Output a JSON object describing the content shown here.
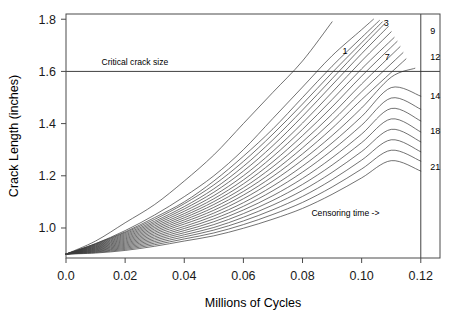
{
  "chart_data": {
    "type": "line",
    "title": "",
    "xlabel": "Millions of Cycles",
    "ylabel": "Crack Length (inches)",
    "xlim": [
      0.0,
      0.1265
    ],
    "ylim": [
      0.885,
      1.82
    ],
    "grid": false,
    "legend_position": "right-margin-curve-labels",
    "xticks": [
      0.0,
      0.02,
      0.04,
      0.06,
      0.08,
      0.1,
      0.12
    ],
    "xticklabels": [
      "0.0",
      "0.02",
      "0.04",
      "0.06",
      "0.08",
      "0.10",
      "0.12"
    ],
    "yticks": [
      1.0,
      1.2,
      1.4,
      1.6,
      1.8
    ],
    "yticklabels": [
      "1.0",
      "1.2",
      "1.4",
      "1.6",
      "1.8"
    ],
    "annotations": [
      {
        "name": "critical-crack-size",
        "text": "Critical crack size",
        "x": 0.012,
        "y": 1.625,
        "kind": "hline-label"
      },
      {
        "name": "censoring-time",
        "text": "Censoring time ->",
        "x": 0.083,
        "y": 1.045,
        "kind": "text"
      }
    ],
    "reference_lines": [
      {
        "name": "critical-crack-size-line",
        "orientation": "horizontal",
        "value": 1.6
      },
      {
        "name": "censoring-time-line",
        "orientation": "vertical",
        "value": 0.12
      }
    ],
    "start_point": {
      "x": 0.0,
      "y": 0.9
    },
    "series": [
      {
        "name": "1",
        "label_shown": true,
        "label_x": 0.0935,
        "label_y": 1.665,
        "x": [
          0.0,
          0.01,
          0.02,
          0.03,
          0.04,
          0.05,
          0.06,
          0.07,
          0.08,
          0.09
        ],
        "y": [
          0.9,
          0.95,
          1.02,
          1.09,
          1.18,
          1.28,
          1.4,
          1.52,
          1.64,
          1.79
        ]
      },
      {
        "name": "2",
        "label_shown": false,
        "x": [
          0.0,
          0.01,
          0.02,
          0.03,
          0.04,
          0.05,
          0.06,
          0.07,
          0.08,
          0.09,
          0.1,
          0.104
        ],
        "y": [
          0.9,
          0.94,
          0.99,
          1.05,
          1.12,
          1.2,
          1.3,
          1.42,
          1.54,
          1.66,
          1.76,
          1.8
        ]
      },
      {
        "name": "3",
        "label_shown": true,
        "label_x": 0.1075,
        "label_y": 1.775,
        "x": [
          0.0,
          0.01,
          0.02,
          0.03,
          0.04,
          0.05,
          0.06,
          0.07,
          0.08,
          0.09,
          0.1,
          0.106
        ],
        "y": [
          0.9,
          0.94,
          0.985,
          1.04,
          1.1,
          1.18,
          1.275,
          1.38,
          1.5,
          1.62,
          1.73,
          1.795
        ]
      },
      {
        "name": "4",
        "label_shown": false,
        "x": [
          0.0,
          0.01,
          0.02,
          0.03,
          0.04,
          0.05,
          0.06,
          0.07,
          0.08,
          0.09,
          0.1,
          0.107
        ],
        "y": [
          0.9,
          0.938,
          0.982,
          1.033,
          1.093,
          1.165,
          1.255,
          1.36,
          1.475,
          1.595,
          1.71,
          1.79
        ]
      },
      {
        "name": "5",
        "label_shown": false,
        "x": [
          0.0,
          0.01,
          0.02,
          0.03,
          0.04,
          0.05,
          0.06,
          0.07,
          0.08,
          0.09,
          0.1,
          0.108
        ],
        "y": [
          0.9,
          0.936,
          0.978,
          1.026,
          1.082,
          1.15,
          1.236,
          1.338,
          1.452,
          1.572,
          1.692,
          1.785
        ]
      },
      {
        "name": "6",
        "label_shown": false,
        "x": [
          0.0,
          0.01,
          0.02,
          0.03,
          0.04,
          0.05,
          0.06,
          0.07,
          0.08,
          0.09,
          0.1,
          0.109
        ],
        "y": [
          0.9,
          0.934,
          0.974,
          1.02,
          1.073,
          1.137,
          1.218,
          1.316,
          1.428,
          1.548,
          1.668,
          1.772
        ]
      },
      {
        "name": "7",
        "label_shown": true,
        "label_x": 0.1078,
        "label_y": 1.645,
        "x": [
          0.0,
          0.01,
          0.02,
          0.03,
          0.04,
          0.05,
          0.06,
          0.07,
          0.08,
          0.09,
          0.1,
          0.11
        ],
        "y": [
          0.9,
          0.932,
          0.97,
          1.014,
          1.064,
          1.124,
          1.2,
          1.294,
          1.402,
          1.52,
          1.64,
          1.752
        ]
      },
      {
        "name": "8",
        "label_shown": false,
        "x": [
          0.0,
          0.01,
          0.02,
          0.03,
          0.04,
          0.05,
          0.06,
          0.07,
          0.08,
          0.09,
          0.1,
          0.111
        ],
        "y": [
          0.9,
          0.93,
          0.966,
          1.008,
          1.055,
          1.112,
          1.184,
          1.274,
          1.378,
          1.492,
          1.61,
          1.73
        ]
      },
      {
        "name": "9",
        "label_shown": true,
        "label_x": 0.1232,
        "label_y": 1.745,
        "x": [
          0.0,
          0.01,
          0.02,
          0.03,
          0.04,
          0.05,
          0.06,
          0.07,
          0.08,
          0.09,
          0.1,
          0.112
        ],
        "y": [
          0.9,
          0.928,
          0.962,
          1.002,
          1.047,
          1.101,
          1.169,
          1.254,
          1.354,
          1.464,
          1.582,
          1.715
        ]
      },
      {
        "name": "10",
        "label_shown": false,
        "x": [
          0.0,
          0.01,
          0.02,
          0.03,
          0.04,
          0.05,
          0.06,
          0.07,
          0.08,
          0.09,
          0.1,
          0.113
        ],
        "y": [
          0.9,
          0.926,
          0.958,
          0.996,
          1.039,
          1.09,
          1.154,
          1.235,
          1.33,
          1.436,
          1.552,
          1.695
        ]
      },
      {
        "name": "11",
        "label_shown": false,
        "x": [
          0.0,
          0.01,
          0.02,
          0.03,
          0.04,
          0.05,
          0.06,
          0.07,
          0.08,
          0.09,
          0.1,
          0.114
        ],
        "y": [
          0.9,
          0.924,
          0.954,
          0.99,
          1.031,
          1.079,
          1.14,
          1.216,
          1.307,
          1.409,
          1.522,
          1.672
        ]
      },
      {
        "name": "12",
        "label_shown": true,
        "label_x": 0.1232,
        "label_y": 1.645,
        "x": [
          0.0,
          0.01,
          0.02,
          0.03,
          0.04,
          0.05,
          0.06,
          0.07,
          0.08,
          0.09,
          0.1,
          0.115
        ],
        "y": [
          0.9,
          0.922,
          0.95,
          0.984,
          1.023,
          1.068,
          1.126,
          1.198,
          1.284,
          1.382,
          1.492,
          1.648
        ]
      },
      {
        "name": "13",
        "label_shown": false,
        "x": [
          0.0,
          0.01,
          0.02,
          0.03,
          0.04,
          0.05,
          0.06,
          0.07,
          0.08,
          0.09,
          0.1,
          0.11,
          0.118
        ],
        "y": [
          0.9,
          0.92,
          0.946,
          0.978,
          1.015,
          1.057,
          1.112,
          1.18,
          1.261,
          1.354,
          1.46,
          1.578,
          1.612
        ]
      },
      {
        "name": "14",
        "label_shown": true,
        "label_x": 0.1232,
        "label_y": 1.495,
        "x": [
          0.0,
          0.01,
          0.02,
          0.03,
          0.04,
          0.05,
          0.06,
          0.07,
          0.08,
          0.09,
          0.1,
          0.11,
          0.12
        ],
        "y": [
          0.9,
          0.918,
          0.942,
          0.972,
          1.006,
          1.046,
          1.097,
          1.161,
          1.237,
          1.326,
          1.427,
          1.538,
          1.505
        ]
      },
      {
        "name": "15",
        "label_shown": false,
        "x": [
          0.0,
          0.01,
          0.02,
          0.03,
          0.04,
          0.05,
          0.06,
          0.07,
          0.08,
          0.09,
          0.1,
          0.11,
          0.12
        ],
        "y": [
          0.9,
          0.916,
          0.938,
          0.966,
          0.998,
          1.035,
          1.083,
          1.143,
          1.214,
          1.298,
          1.394,
          1.498,
          1.455
        ]
      },
      {
        "name": "16",
        "label_shown": false,
        "x": [
          0.0,
          0.01,
          0.02,
          0.03,
          0.04,
          0.05,
          0.06,
          0.07,
          0.08,
          0.09,
          0.1,
          0.11,
          0.12
        ],
        "y": [
          0.9,
          0.914,
          0.934,
          0.96,
          0.99,
          1.024,
          1.069,
          1.124,
          1.19,
          1.269,
          1.36,
          1.458,
          1.41
        ]
      },
      {
        "name": "17",
        "label_shown": false,
        "x": [
          0.0,
          0.01,
          0.02,
          0.03,
          0.04,
          0.05,
          0.06,
          0.07,
          0.08,
          0.09,
          0.1,
          0.11,
          0.12
        ],
        "y": [
          0.9,
          0.912,
          0.93,
          0.954,
          0.982,
          1.013,
          1.055,
          1.106,
          1.167,
          1.241,
          1.327,
          1.418,
          1.368
        ]
      },
      {
        "name": "18",
        "label_shown": true,
        "label_x": 0.1232,
        "label_y": 1.36,
        "x": [
          0.0,
          0.01,
          0.02,
          0.03,
          0.04,
          0.05,
          0.06,
          0.07,
          0.08,
          0.09,
          0.1,
          0.11,
          0.12
        ],
        "y": [
          0.9,
          0.91,
          0.926,
          0.948,
          0.974,
          1.002,
          1.041,
          1.088,
          1.144,
          1.213,
          1.293,
          1.378,
          1.33
        ]
      },
      {
        "name": "19",
        "label_shown": false,
        "x": [
          0.0,
          0.01,
          0.02,
          0.03,
          0.04,
          0.05,
          0.06,
          0.07,
          0.08,
          0.09,
          0.1,
          0.11,
          0.12
        ],
        "y": [
          0.9,
          0.908,
          0.922,
          0.942,
          0.966,
          0.992,
          1.027,
          1.07,
          1.121,
          1.185,
          1.26,
          1.338,
          1.292
        ]
      },
      {
        "name": "20",
        "label_shown": false,
        "x": [
          0.0,
          0.01,
          0.02,
          0.03,
          0.04,
          0.05,
          0.06,
          0.07,
          0.08,
          0.09,
          0.1,
          0.11,
          0.12
        ],
        "y": [
          0.9,
          0.906,
          0.918,
          0.936,
          0.958,
          0.981,
          1.013,
          1.052,
          1.098,
          1.157,
          1.226,
          1.298,
          1.256
        ]
      },
      {
        "name": "21",
        "label_shown": true,
        "label_x": 0.1232,
        "label_y": 1.222,
        "x": [
          0.0,
          0.01,
          0.02,
          0.03,
          0.04,
          0.05,
          0.06,
          0.07,
          0.08,
          0.09,
          0.1,
          0.11,
          0.12
        ],
        "y": [
          0.9,
          0.904,
          0.914,
          0.93,
          0.95,
          0.97,
          0.999,
          1.034,
          1.075,
          1.129,
          1.192,
          1.258,
          1.218
        ]
      }
    ]
  },
  "colors": {
    "curve": "#3a3a3a",
    "frame": "#4a4a4a",
    "reference_line": "#2b2b2b",
    "text": "#000000",
    "background": "#ffffff"
  }
}
